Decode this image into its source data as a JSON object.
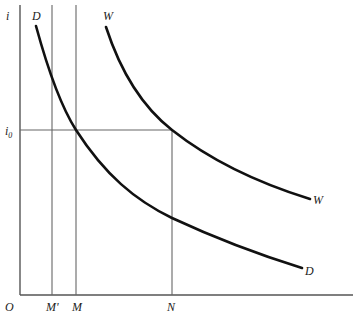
{
  "diagram": {
    "type": "economics-curve-diagram",
    "axes": {
      "y_label": "i",
      "origin_label": "O"
    },
    "y_ticks": [
      {
        "label_base": "i",
        "label_sub": "0",
        "role": "equilibrium interest rate"
      }
    ],
    "x_ticks": [
      {
        "label": "M'"
      },
      {
        "label": "M"
      },
      {
        "label": "N"
      }
    ],
    "curves": [
      {
        "name": "D",
        "label_top": "D",
        "label_end": "D"
      },
      {
        "name": "W",
        "label_top": "W",
        "label_end": "W"
      }
    ],
    "colors": {
      "curve": "#111111",
      "axis": "#555555",
      "guide": "#666666",
      "background": "#ffffff"
    }
  }
}
